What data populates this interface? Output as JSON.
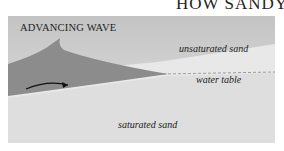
{
  "header": {
    "title_fragment": "HOW SANDY B"
  },
  "diagram": {
    "title": "ADVANCING WAVE",
    "labels": {
      "unsaturated": "unsaturated sand",
      "water_table": "water table",
      "saturated": "saturated sand"
    },
    "colors": {
      "sky": "#c9c9c9",
      "unsaturated_sand": "#e6e6e6",
      "water": "#8e8e8e",
      "saturated_sand": "#e0e0e0",
      "arrow": "#111111"
    }
  }
}
